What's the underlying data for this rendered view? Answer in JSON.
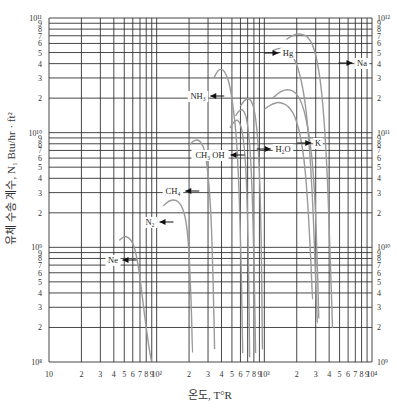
{
  "chart_data": {
    "type": "line",
    "title": "",
    "xlabel": "온도, T°R",
    "ylabel": "유체 수송 계수, N₁ Btu/hr · ft²",
    "xscale": "log",
    "yscale": "log",
    "xlim": [
      10,
      10000
    ],
    "ylim_left": [
      100000000.0,
      100000000000.0
    ],
    "ylim_right": [
      1000000000.0,
      1000000000000.0
    ],
    "grid": true,
    "x_tick_labels": [
      "10",
      "2",
      "3",
      "4",
      "5",
      "6",
      "7",
      "8",
      "9",
      "10²",
      "2",
      "3",
      "4",
      "5",
      "6",
      "7",
      "8",
      "9",
      "10³",
      "2",
      "3",
      "4",
      "5",
      "6",
      "7",
      "8",
      "9",
      "10⁴"
    ],
    "y_left_tick_labels": [
      "10⁸",
      "2",
      "3",
      "4",
      "5",
      "6",
      "7",
      "8",
      "9",
      "10⁹",
      "2",
      "3",
      "4",
      "5",
      "6",
      "7",
      "8",
      "9",
      "10¹⁰",
      "2",
      "3",
      "4",
      "5",
      "6",
      "7",
      "8",
      "9",
      "10¹¹"
    ],
    "y_right_tick_labels": [
      "10⁹",
      "2",
      "3",
      "4",
      "5",
      "6",
      "7",
      "8",
      "9",
      "10¹⁰",
      "2",
      "3",
      "4",
      "5",
      "6",
      "7",
      "8",
      "9",
      "10¹¹",
      "2",
      "3",
      "4",
      "5",
      "6",
      "7",
      "8",
      "9",
      "10¹²"
    ],
    "series": [
      {
        "name": "Ne",
        "axis": "left",
        "x": [
          45,
          50,
          55,
          60,
          65,
          70,
          75,
          80,
          85,
          90
        ],
        "y": [
          1150000000.0,
          1250000000.0,
          1220000000.0,
          1100000000.0,
          850000000.0,
          550000000.0,
          320000000.0,
          200000000.0,
          130000000.0,
          100000000.0
        ]
      },
      {
        "name": "N2",
        "axis": "left",
        "x": [
          115,
          130,
          145,
          160,
          175,
          190,
          200,
          210,
          215
        ],
        "y": [
          2300000000.0,
          2550000000.0,
          2600000000.0,
          2500000000.0,
          2200000000.0,
          1600000000.0,
          900000000.0,
          300000000.0,
          120000000.0
        ]
      },
      {
        "name": "CH4",
        "axis": "left",
        "x": [
          200,
          220,
          240,
          260,
          280,
          300,
          320,
          335,
          345
        ],
        "y": [
          7800000000.0,
          8500000000.0,
          8700000000.0,
          8200000000.0,
          7000000000.0,
          4500000000.0,
          2000000000.0,
          500000000.0,
          130000000.0
        ]
      },
      {
        "name": "NH3",
        "axis": "left",
        "x": [
          340,
          370,
          400,
          430,
          470,
          510,
          560,
          600,
          630
        ],
        "y": [
          30000000000.0,
          35000000000.0,
          36000000000.0,
          34000000000.0,
          28000000000.0,
          18000000000.0,
          8000000000.0,
          1500000000.0,
          120000000.0
        ]
      },
      {
        "name": "CH3OH",
        "axis": "left",
        "x": [
          480,
          520,
          560,
          600,
          640,
          680,
          710,
          730
        ],
        "y": [
          11000000000.0,
          12500000000.0,
          13000000000.0,
          12000000000.0,
          9000000000.0,
          4500000000.0,
          1000000000.0,
          110000000.0
        ]
      },
      {
        "name": "H2O",
        "axis": "left",
        "x": [
          540,
          580,
          620,
          660,
          700,
          750,
          790,
          830
        ],
        "y": [
          14000000000.0,
          15500000000.0,
          16000000000.0,
          15000000000.0,
          12000000000.0,
          6000000000.0,
          1500000000.0,
          120000000.0
        ]
      },
      {
        "name": "H2O-2",
        "axis": "left",
        "x": [
          600,
          650,
          700,
          760,
          820,
          880,
          930,
          960
        ],
        "y": [
          17000000000.0,
          19000000000.0,
          20000000000.0,
          19000000000.0,
          15000000000.0,
          8000000000.0,
          2000000000.0,
          130000000.0
        ]
      },
      {
        "name": "Hg",
        "axis": "right",
        "x": [
          1200,
          1400,
          1600,
          1900,
          2200,
          2500,
          2800,
          3000,
          3100
        ],
        "y": [
          520000000000.0,
          550000000000.0,
          530000000000.0,
          450000000000.0,
          300000000000.0,
          140000000000.0,
          30000000000.0,
          5000000000.0,
          2200000000.0
        ]
      },
      {
        "name": "Na",
        "axis": "right",
        "x": [
          1600,
          1900,
          2200,
          2600,
          3000,
          3400,
          3800,
          4100,
          4300
        ],
        "y": [
          650000000000.0,
          720000000000.0,
          730000000000.0,
          680000000000.0,
          500000000000.0,
          250000000000.0,
          60000000000.0,
          8000000000.0,
          2000000000.0
        ]
      },
      {
        "name": "K",
        "axis": "right",
        "x": [
          1200,
          1400,
          1700,
          2000,
          2300,
          2600,
          2900,
          3100,
          3200
        ],
        "y": [
          200000000000.0,
          230000000000.0,
          240000000000.0,
          220000000000.0,
          170000000000.0,
          100000000000.0,
          40000000000.0,
          8000000000.0,
          2400000000.0
        ]
      },
      {
        "name": "Hg-low",
        "axis": "right",
        "x": [
          1000,
          1200,
          1400,
          1700,
          2000,
          2300,
          2500,
          2700,
          2800
        ],
        "y": [
          160000000000.0,
          180000000000.0,
          185000000000.0,
          170000000000.0,
          130000000000.0,
          70000000000.0,
          30000000000.0,
          8000000000.0,
          3500000000.0
        ]
      }
    ],
    "annotations": [
      {
        "text": "Ne",
        "x_px": 113,
        "y_px": 263,
        "arrow": "left"
      },
      {
        "text": "N₂",
        "x_px": 150,
        "y_px": 225,
        "arrow": "left"
      },
      {
        "text": "CH₄",
        "x_px": 173,
        "y_px": 194,
        "arrow": "left"
      },
      {
        "text": "NH₃",
        "x_px": 198,
        "y_px": 99,
        "arrow": "left"
      },
      {
        "text": "CH₃ OH",
        "x_px": 210,
        "y_px": 158,
        "arrow": "left"
      },
      {
        "text": "H₂O",
        "x_px": 283,
        "y_px": 152,
        "arrow": "right"
      },
      {
        "text": "K",
        "x_px": 318,
        "y_px": 146,
        "arrow": "right"
      },
      {
        "text": "Hg",
        "x_px": 288,
        "y_px": 56,
        "arrow": "right"
      },
      {
        "text": "Na",
        "x_px": 362,
        "y_px": 66,
        "arrow": "right"
      }
    ]
  }
}
